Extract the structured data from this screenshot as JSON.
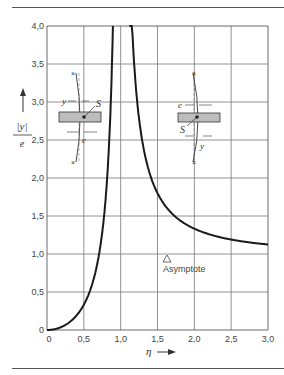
{
  "chart_data": {
    "type": "line",
    "title": "",
    "xlabel": "η",
    "ylabel": "|y| / e",
    "xlim": [
      0,
      3.0
    ],
    "ylim": [
      0,
      4.0
    ],
    "grid": true,
    "x_ticks": [
      "0",
      "0,5",
      "1,0",
      "1,5",
      "2,0",
      "2,5",
      "3,0"
    ],
    "y_ticks": [
      "0",
      "0,5",
      "1,0",
      "1,5",
      "2,0",
      "2,5",
      "3,0",
      "3,5",
      "4,0"
    ],
    "series": [
      {
        "name": "|y|/e",
        "x": [
          0,
          0.1,
          0.2,
          0.3,
          0.4,
          0.5,
          0.6,
          0.7,
          0.75,
          0.8,
          0.85,
          0.88,
          1.12,
          1.15,
          1.2,
          1.3,
          1.4,
          1.5,
          1.75,
          2.0,
          2.25,
          2.5,
          2.75,
          3.0
        ],
        "values": [
          0,
          0.01,
          0.04,
          0.1,
          0.19,
          0.33,
          0.56,
          0.96,
          1.29,
          1.78,
          2.6,
          3.4,
          4.0,
          3.1,
          2.27,
          1.45,
          1.04,
          1.8,
          1.48,
          1.33,
          1.25,
          1.19,
          1.15,
          1.125
        ]
      }
    ],
    "annotations": [
      {
        "text": "Asymptote",
        "x": 1.65,
        "y": 1.0,
        "marker": "triangle"
      }
    ],
    "insets": [
      {
        "position": "left",
        "labels": [
          "y",
          "S",
          "e"
        ]
      },
      {
        "position": "right",
        "labels": [
          "e",
          "S",
          "y"
        ]
      }
    ]
  },
  "axes": {
    "x_label": "η",
    "y_label_num": "|y|",
    "y_label_den": "e"
  },
  "annotation": {
    "asymptote_label": "Asymptote",
    "asymptote_marker": "△"
  },
  "inset_left": {
    "y": "y",
    "s": "S",
    "e": "e"
  },
  "inset_right": {
    "e": "e",
    "s": "S",
    "y": "y"
  }
}
